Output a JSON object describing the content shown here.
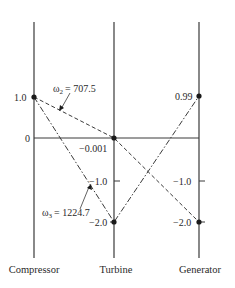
{
  "diagram": {
    "type": "mode-shape diagram",
    "stations": [
      {
        "name": "Compressor",
        "x": 34
      },
      {
        "name": "Turbine",
        "x": 114
      },
      {
        "name": "Generator",
        "x": 199
      }
    ],
    "zero_label": "0",
    "modes": [
      {
        "label": "ω2 = 707.5",
        "omega_symbol": "ω",
        "omega_sub": "2",
        "omega_value": "= 707.5",
        "style": "dashed",
        "values": [
          1.0,
          -0.001,
          -2.0
        ],
        "value_labels": [
          "1.0",
          "−0.001",
          "−2.0"
        ]
      },
      {
        "label": "ω3 = 1224.7",
        "omega_symbol": "ω",
        "omega_sub": "3",
        "omega_value": "= 1224.7",
        "style": "dash-dot",
        "values": [
          1.0,
          -2.0,
          0.99
        ],
        "value_labels": [
          "1.0",
          "−2.0",
          "0.99"
        ]
      }
    ],
    "tick_labels": {
      "compressor_one": "1.0",
      "zero": "0",
      "turbine_minus_0001": "−0.001",
      "turbine_minus_one": "−1.0",
      "turbine_minus_two": "−2.0",
      "generator_099": "0.99",
      "generator_minus_one": "−1.0",
      "generator_minus_two": "−2.0"
    },
    "colors": {
      "line": "#3a3a3a",
      "text": "#2a2a2a",
      "background": "#ffffff"
    }
  }
}
